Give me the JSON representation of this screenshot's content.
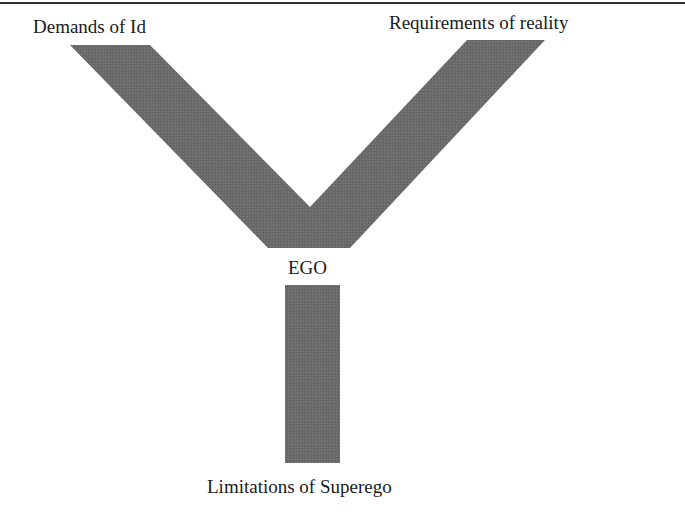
{
  "diagram": {
    "type": "Y-shaped flow diagram",
    "fill_color": "#6b6b6b",
    "labels": {
      "id": "Demands of Id",
      "reality": "Requirements of reality",
      "ego": "EGO",
      "superego": "Limitations of Superego"
    }
  }
}
